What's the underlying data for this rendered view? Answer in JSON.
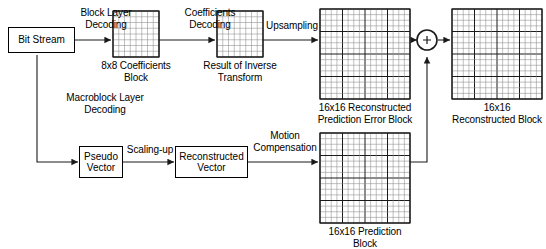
{
  "diagram": {
    "colors": {
      "line": "#1a1a1a",
      "grid_fine": "#8c8c8c",
      "grid_coarse": "#1a1a1a",
      "background": "#ffffff"
    },
    "nodes": {
      "bit_stream": {
        "label": "Bit Stream"
      },
      "pseudo_vector": {
        "label": "Pseudo\nVector"
      },
      "reconstructed_vector": {
        "label": "Reconstructed\nVector"
      },
      "adder": {
        "label": "+"
      }
    },
    "edge_labels": {
      "block_layer_decoding": "Block Layer\nDecoding",
      "coefficients_decoding": "Coefficients\nDecoding",
      "upsampling": "Upsampling",
      "macroblock_layer_decoding": "Macroblock Layer\nDecoding",
      "scaling_up": "Scaling-up",
      "motion_compensation": "Motion\nCompensation"
    },
    "blocks": [
      {
        "name": "coefficients-block",
        "caption": "8x8 Coefficients\nBlock",
        "grid": 8,
        "coarse_every": 8,
        "x": 113,
        "y": 11,
        "size": 46
      },
      {
        "name": "inverse-transform-block",
        "caption": "Result of Inverse\nTransform",
        "grid": 8,
        "coarse_every": 8,
        "x": 217,
        "y": 11,
        "size": 46
      },
      {
        "name": "prediction-error-block",
        "caption": "16x16 Reconstructed\nPrediction Error Block",
        "grid": 16,
        "coarse_every": 4,
        "x": 320,
        "y": 9,
        "size": 90
      },
      {
        "name": "reconstructed-block",
        "caption": "16x16\nReconstructed Block",
        "grid": 16,
        "coarse_every": 4,
        "x": 452,
        "y": 9,
        "size": 90
      },
      {
        "name": "prediction-block",
        "caption": "16x16 Prediction\nBlock",
        "grid": 16,
        "coarse_every": 4,
        "x": 320,
        "y": 133,
        "size": 90
      }
    ]
  }
}
